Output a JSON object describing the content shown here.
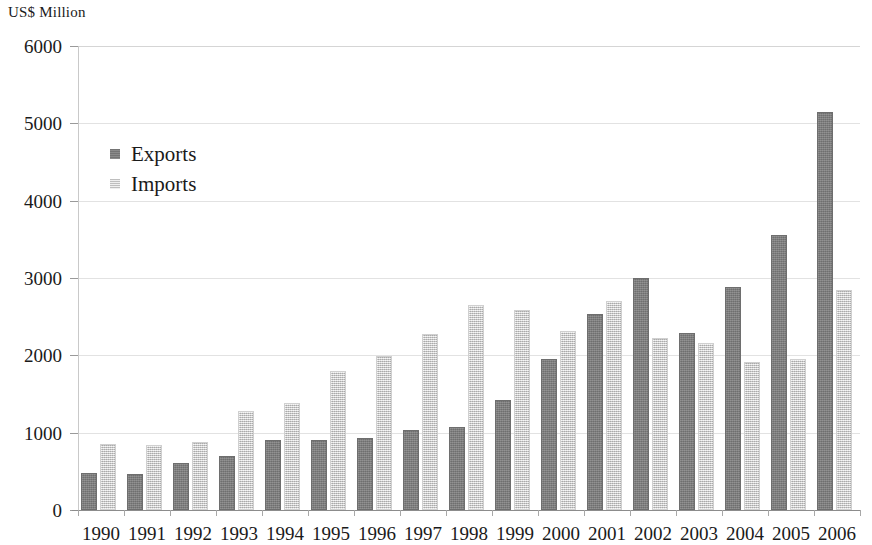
{
  "axis_title": "US$ Million",
  "legend": {
    "exports_label": "Exports",
    "imports_label": "Imports",
    "exports_color": "#7d7d7d",
    "imports_color": "#dcdcdc"
  },
  "chart_data": {
    "type": "bar",
    "title": "",
    "subtitle": "",
    "xlabel": "",
    "ylabel": "US$ Million",
    "ylim": [
      0,
      6000
    ],
    "yticks": [
      0,
      1000,
      2000,
      3000,
      4000,
      5000,
      6000
    ],
    "ytick_labels": [
      "0",
      "1000",
      "2000",
      "3000",
      "4000",
      "5000",
      "6000"
    ],
    "grid": true,
    "legend_position": "upper-left-inside",
    "categories": [
      "1990",
      "1991",
      "1992",
      "1993",
      "1994",
      "1995",
      "1996",
      "1997",
      "1998",
      "1999",
      "2000",
      "2001",
      "2002",
      "2003",
      "2004",
      "2005",
      "2006"
    ],
    "series": [
      {
        "name": "Exports",
        "color": "#7d7d7d",
        "values": [
          480,
          470,
          610,
          700,
          910,
          900,
          930,
          1030,
          1070,
          1420,
          1950,
          2530,
          3000,
          2290,
          2880,
          3550,
          5150
        ]
      },
      {
        "name": "Imports",
        "color": "#dcdcdc",
        "values": [
          860,
          840,
          880,
          1280,
          1380,
          1800,
          1990,
          2280,
          2650,
          2580,
          2310,
          2700,
          2230,
          2160,
          1920,
          1950,
          2850
        ]
      }
    ]
  }
}
